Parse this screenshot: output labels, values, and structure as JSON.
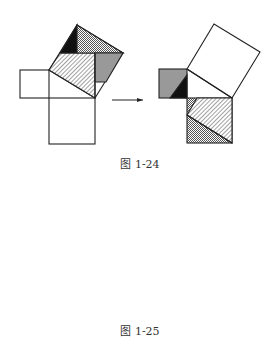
{
  "figures": [
    {
      "caption": "图 1-24",
      "description": "Pythagorean dissection: pieces of the hypotenuse square rearranged into the two leg squares"
    },
    {
      "caption": "图 1-25",
      "description": "Pythagorean dissection: pieces of the two leg squares rearranged into the hypotenuse square"
    }
  ],
  "colors": {
    "stroke": "#222222",
    "gray": "#999999",
    "black": "#111111",
    "white": "#ffffff"
  },
  "arrow_label": "→"
}
